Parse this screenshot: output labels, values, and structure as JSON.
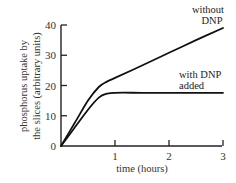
{
  "chart_data": {
    "type": "line",
    "title": "",
    "xlabel": "time (hours)",
    "ylabel_lines": [
      "phosphorus uptake by",
      "the slices (arbitrary units)"
    ],
    "ylabel": "phosphorus uptake by the slices (arbitrary units)",
    "xlim": [
      0,
      3
    ],
    "ylim": [
      0,
      40
    ],
    "x_ticks": [
      1,
      2,
      3
    ],
    "x_tick_labels": [
      "1",
      "2",
      "3"
    ],
    "y_ticks": [
      0,
      10,
      20,
      30,
      40
    ],
    "y_tick_labels": [
      "0",
      "10",
      "20",
      "30",
      "40"
    ],
    "grid": false,
    "legend": "inline labels near curve ends",
    "series": [
      {
        "name": "without DNP",
        "label_lines": [
          "without",
          "DNP"
        ],
        "x": [
          0,
          0.25,
          0.5,
          0.7,
          0.85,
          1.0,
          1.5,
          2.0,
          2.5,
          3.0
        ],
        "values": [
          0,
          7.5,
          15,
          19.5,
          21.3,
          22.5,
          26.6,
          30.8,
          35,
          39
        ]
      },
      {
        "name": "with DNP added",
        "label_lines": [
          "with DNP",
          "added"
        ],
        "x": [
          0,
          0.25,
          0.5,
          0.7,
          0.85,
          1.0,
          1.5,
          2.0,
          2.5,
          3.0
        ],
        "values": [
          0,
          6,
          12,
          16,
          17.3,
          17.6,
          17.6,
          17.6,
          17.6,
          17.6
        ]
      }
    ]
  }
}
